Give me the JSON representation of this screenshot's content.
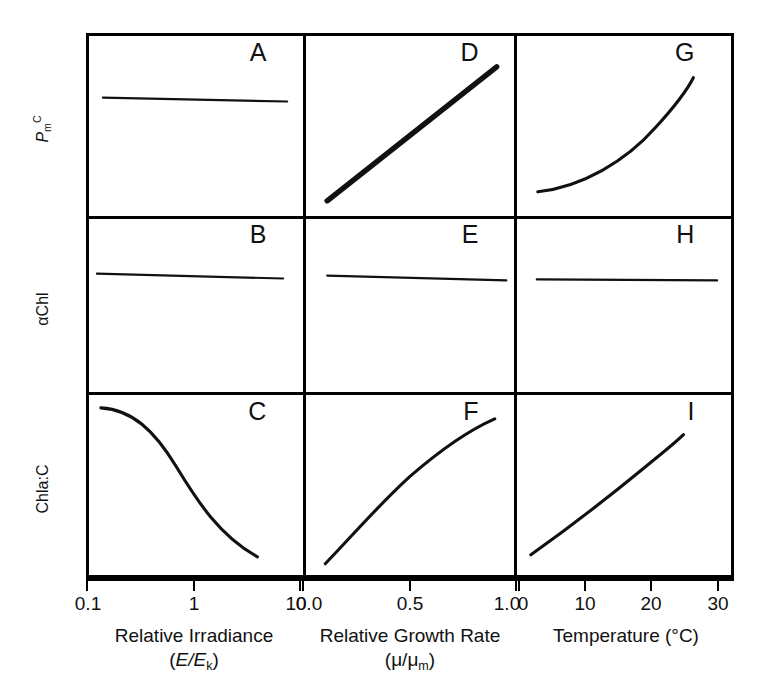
{
  "figure": {
    "type": "small-multiples-grid",
    "rows": 3,
    "cols": 3,
    "line_color": "#111111",
    "background": "#ffffff"
  },
  "y_axes": [
    {
      "id": "row1",
      "label_html": "P_m^C",
      "label_plain": "PmC"
    },
    {
      "id": "row2",
      "label_html": "αChl",
      "label_plain": "alphaChl"
    },
    {
      "id": "row3",
      "label_html": "Chla:C",
      "label_plain": "Chla:C"
    }
  ],
  "y_axis_row1": {
    "base": "P",
    "sub": "m",
    "sup": "C"
  },
  "y_axis_row2": {
    "text": "αChl"
  },
  "y_axis_row3": {
    "text": "Chla:C"
  },
  "x_axes": [
    {
      "id": "col1",
      "title": "Relative Irradiance",
      "unit": "(E/Eₖ)",
      "unit_base": "E/E",
      "unit_sub": "k",
      "scale": "log",
      "ticks": [
        {
          "label": "0.1",
          "pos": 0.0
        },
        {
          "label": "1",
          "pos": 0.5
        },
        {
          "label": "10",
          "pos": 1.0
        }
      ]
    },
    {
      "id": "col2",
      "title": "Relative Growth Rate",
      "unit": "(μ/μₘ)",
      "unit_base": "μ/μ",
      "unit_sub": "m",
      "scale": "linear",
      "ticks": [
        {
          "label": "0.0",
          "pos": 0.0
        },
        {
          "label": "0.5",
          "pos": 0.5
        },
        {
          "label": "1.0",
          "pos": 1.0
        }
      ]
    },
    {
      "id": "col3",
      "title": "Temperature (°C)",
      "unit": "",
      "scale": "linear",
      "ticks": [
        {
          "label": "0",
          "pos": 0.0
        },
        {
          "label": "10",
          "pos": 0.305
        },
        {
          "label": "20",
          "pos": 0.61
        },
        {
          "label": "30",
          "pos": 0.92
        }
      ]
    }
  ],
  "panels": [
    {
      "id": "A",
      "row": 1,
      "col": 1,
      "label": "A",
      "ylabel": "P_m^C",
      "xlabel": "Relative Irradiance",
      "shape": "flat",
      "stroke": "thin",
      "path": "M 14 62 L 200 66"
    },
    {
      "id": "D",
      "row": 1,
      "col": 2,
      "label": "D",
      "ylabel": "P_m^C",
      "xlabel": "Relative Growth Rate",
      "shape": "linear-increasing",
      "stroke": "thick",
      "path": "M 22 166 L 198 31"
    },
    {
      "id": "G",
      "row": 1,
      "col": 3,
      "label": "G",
      "ylabel": "P_m^C",
      "xlabel": "Temperature",
      "shape": "exponential-increasing",
      "stroke": "med",
      "path": "M 21 157 C 66 152, 110 126, 140 92 C 160 70, 172 54, 178 42"
    },
    {
      "id": "B",
      "row": 2,
      "col": 1,
      "label": "B",
      "ylabel": "αChl",
      "xlabel": "Relative Irradiance",
      "shape": "flat",
      "stroke": "thin",
      "path": "M 8 57 L 196 62"
    },
    {
      "id": "E",
      "row": 2,
      "col": 2,
      "label": "E",
      "ylabel": "αChl",
      "xlabel": "Relative Growth Rate",
      "shape": "flat",
      "stroke": "thin",
      "path": "M 22 59 L 208 64"
    },
    {
      "id": "H",
      "row": 2,
      "col": 3,
      "label": "H",
      "ylabel": "αChl",
      "xlabel": "Temperature",
      "shape": "flat",
      "stroke": "thin",
      "path": "M 20 63 L 202 64"
    },
    {
      "id": "C",
      "row": 3,
      "col": 1,
      "label": "C",
      "ylabel": "Chla:C",
      "xlabel": "Relative Irradiance",
      "shape": "sigmoid-decreasing",
      "stroke": "med",
      "path": "M 12 13 C 44 15, 66 36, 88 72 C 110 108, 132 142, 170 163"
    },
    {
      "id": "F",
      "row": 3,
      "col": 2,
      "label": "F",
      "ylabel": "Chla:C",
      "xlabel": "Relative Growth Rate",
      "shape": "saturating-increasing",
      "stroke": "med",
      "path": "M 20 170 C 48 142, 74 112, 108 82 C 140 55, 170 35, 196 24"
    },
    {
      "id": "I",
      "row": 3,
      "col": 3,
      "label": "I",
      "ylabel": "Chla:C",
      "xlabel": "Temperature",
      "shape": "linear-increasing",
      "stroke": "med",
      "path": "M 14 161 C 52 134, 96 100, 130 72 C 150 56, 162 46, 168 40"
    }
  ]
}
